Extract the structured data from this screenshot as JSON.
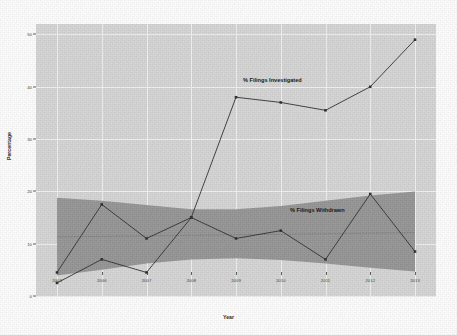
{
  "chart_data": {
    "type": "line",
    "title": "",
    "xlabel": "Year",
    "ylabel": "Percentage",
    "categories": [
      "2003",
      "2006",
      "2007",
      "2008",
      "2009",
      "2010",
      "2011",
      "2012",
      "2013"
    ],
    "x_tick_labels": [
      "2003",
      "2006",
      "2007",
      "2008",
      "2009",
      "2010",
      "2011",
      "2012",
      "2013"
    ],
    "y_tick_labels": [
      "0",
      "10",
      "20",
      "30",
      "40",
      "50"
    ],
    "y_tick_values": [
      0,
      10,
      20,
      30,
      40,
      50
    ],
    "ylim": [
      0,
      52
    ],
    "grid": true,
    "legend_position": "inline-annotation",
    "series": [
      {
        "name": "% Filings Investigated",
        "annotation": "% Filings Investigated",
        "values": [
          2.5,
          7.0,
          4.5,
          15.0,
          38.0,
          37.0,
          35.5,
          40.0,
          49.0
        ],
        "marker": "square",
        "color": "#2b2b2b"
      },
      {
        "name": "% Filings Withdrawn",
        "annotation": "% Filings Withdrawn",
        "values": [
          4.5,
          17.5,
          11.0,
          15.0,
          11.0,
          12.5,
          7.0,
          19.5,
          8.5
        ],
        "marker": "square",
        "color": "#2b2b2b"
      }
    ],
    "confidence_band": {
      "label": "",
      "upper": [
        18.8,
        18.2,
        17.4,
        16.6,
        16.6,
        17.2,
        18.2,
        19.2,
        20.0
      ],
      "lower": [
        3.9,
        5.0,
        6.2,
        7.0,
        7.2,
        6.9,
        6.2,
        5.4,
        4.7
      ],
      "trend_line": [
        11.3,
        11.4,
        11.5,
        11.6,
        11.7,
        11.8,
        11.9,
        12.0,
        12.1
      ],
      "color": "#8f8f8f"
    },
    "colors": {
      "panel_background": "#d6d6d6",
      "gridline": "#f2f2f2",
      "line": "#2b2b2b",
      "band": "#8f8f8f",
      "text": "#1a1a1a"
    }
  }
}
